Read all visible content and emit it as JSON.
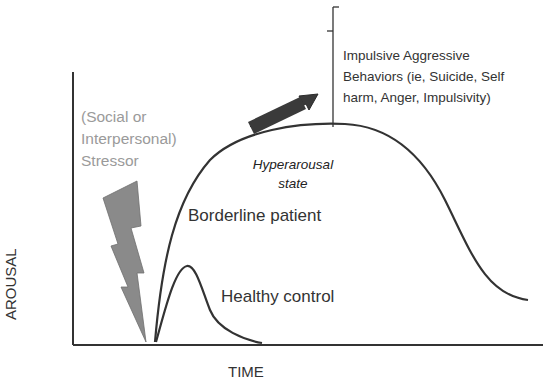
{
  "diagram": {
    "axes": {
      "x_label": "TIME",
      "y_label": "AROUSAL"
    },
    "stressor": {
      "lines": [
        "(Social or",
        "Interpersonal)",
        "Stressor"
      ],
      "icon": "lightning-bolt-icon",
      "color": "#8a8a8a"
    },
    "curves": {
      "borderline": "Borderline patient",
      "healthy": "Healthy control"
    },
    "hyperarousal": {
      "lines": [
        "Hyperarousal",
        "state"
      ]
    },
    "impulsive": {
      "lines": [
        "Impulsive Aggressive",
        "Behaviors (ie, Suicide, Self",
        "harm, Anger, Impulsivity)"
      ]
    },
    "colors": {
      "line": "#333333",
      "arrow": "#333333",
      "stressor_text": "#9a9a9a"
    }
  }
}
